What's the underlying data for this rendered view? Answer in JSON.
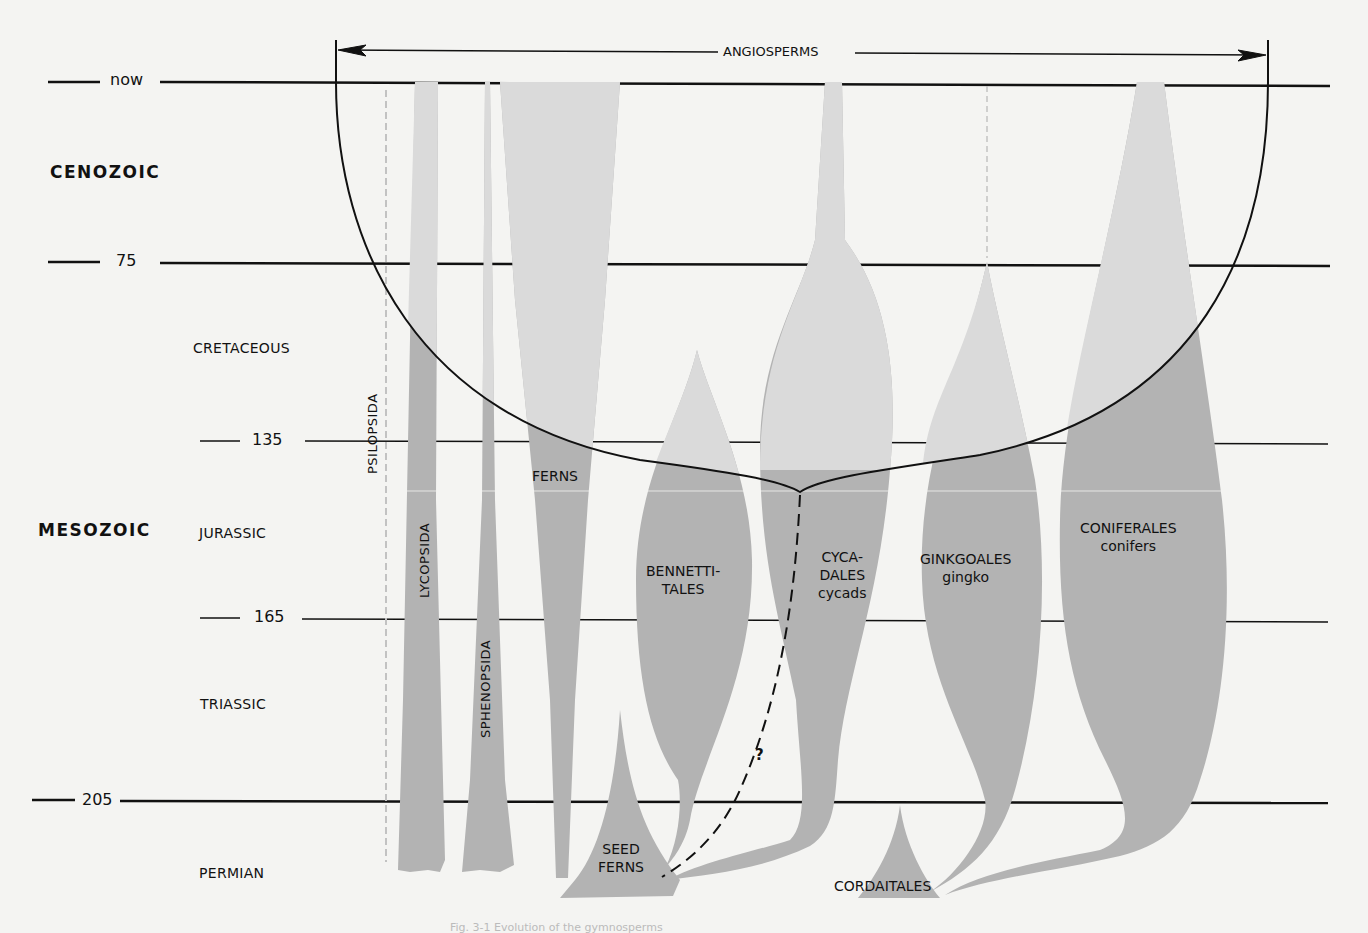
{
  "figure": {
    "title": "ANGIOSPERMS",
    "question_mark": "?",
    "colors": {
      "background": "#f4f4f2",
      "line": "#111111",
      "shape_inside_bowl": "#dadada",
      "shape_outside_bowl": "#b3b3b3"
    }
  },
  "time_scale": {
    "ticks": [
      {
        "label": "now",
        "y": 82
      },
      {
        "label": "75",
        "y": 264
      },
      {
        "label": "135",
        "y": 442
      },
      {
        "label": "165",
        "y": 620
      },
      {
        "label": "205",
        "y": 801
      }
    ],
    "eras": [
      {
        "label": "CENOZOIC",
        "y": 174
      },
      {
        "label": "MESOZOIC",
        "y": 531
      }
    ],
    "periods": [
      {
        "label": "CRETACEOUS",
        "y": 348
      },
      {
        "label": "JURASSIC",
        "y": 533
      },
      {
        "label": "TRIASSIC",
        "y": 704
      },
      {
        "label": "PERMIAN",
        "y": 872
      }
    ]
  },
  "groups": [
    {
      "name": "PSILOPSIDA",
      "common": ""
    },
    {
      "name": "LYCOPSIDA",
      "common": ""
    },
    {
      "name": "SPHENOPSIDA",
      "common": ""
    },
    {
      "name": "FERNS",
      "common": ""
    },
    {
      "name": "BENNETTI-",
      "name2": "TALES",
      "common": ""
    },
    {
      "name": "SEED",
      "name2": "FERNS",
      "common": ""
    },
    {
      "name": "CYCA-",
      "name2": "DALES",
      "common": "cycads"
    },
    {
      "name": "GINKGOALES",
      "common": "gingko"
    },
    {
      "name": "CONIFERALES",
      "common": "conifers"
    },
    {
      "name": "CORDAITALES",
      "common": ""
    }
  ],
  "caption": "Fig. 3-1  Evolution of the gymnosperms"
}
